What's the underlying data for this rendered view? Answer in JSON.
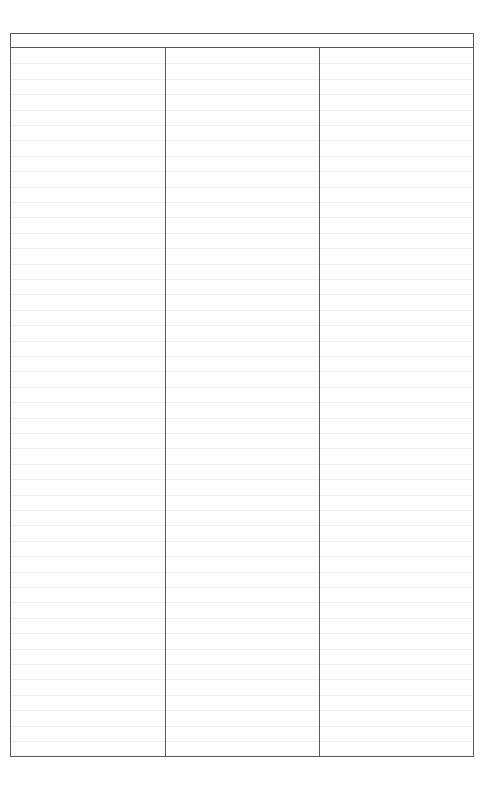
{
  "document": {
    "type": "blank-ruled-form",
    "page_background": "#ffffff",
    "border_color": "#555a5e",
    "rule_line_color": "#eceef0"
  },
  "table": {
    "columns": [
      {
        "header": "",
        "body_text": ""
      },
      {
        "header": "",
        "body_text": ""
      },
      {
        "header": "",
        "body_text": ""
      }
    ],
    "header_row": {
      "cells": [
        "",
        "",
        ""
      ]
    },
    "body": {
      "rule_line_count": 46,
      "rule_line_spacing_px": 15.4,
      "rows": []
    }
  }
}
